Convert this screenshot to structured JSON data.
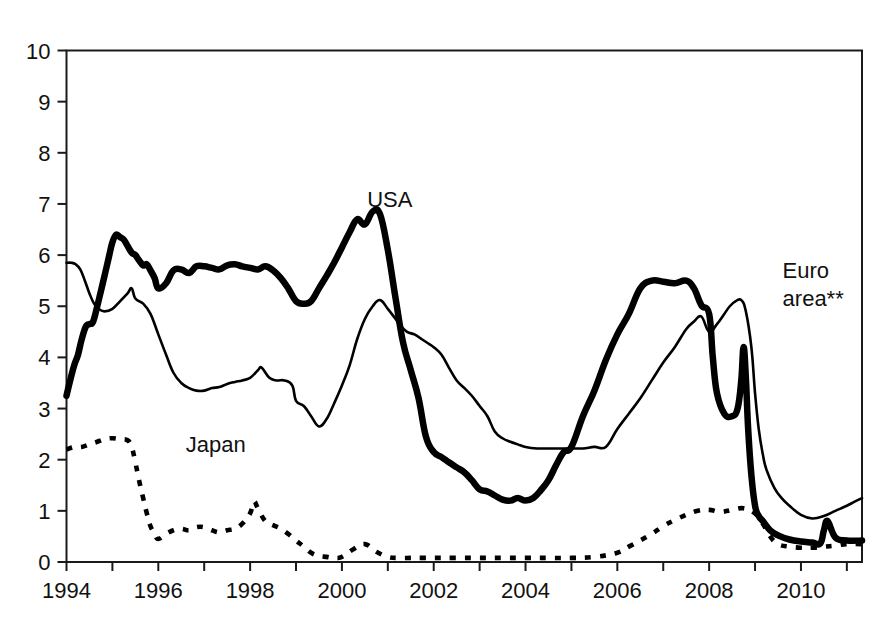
{
  "chart_data": {
    "type": "line",
    "title": "",
    "subtitle": "",
    "xlabel": "",
    "ylabel": "",
    "xlim": [
      1994.0,
      2011.33
    ],
    "ylim": [
      0,
      10
    ],
    "ytick_values": [
      0,
      1,
      2,
      3,
      4,
      5,
      6,
      7,
      8,
      9,
      10
    ],
    "ytick_labels": [
      "0",
      "1",
      "2",
      "3",
      "4",
      "5",
      "6",
      "7",
      "8",
      "9",
      "10"
    ],
    "xtick_values": [
      1994,
      1996,
      1998,
      2000,
      2002,
      2004,
      2006,
      2008,
      2010
    ],
    "xtick_labels": [
      "1994",
      "1996",
      "1998",
      "2000",
      "2002",
      "2004",
      "2006",
      "2008",
      "2010"
    ],
    "xtick_minor_values": [
      1995,
      1997,
      1999,
      2001,
      2003,
      2005,
      2007,
      2009,
      2011
    ],
    "grid": false,
    "legend_position": "inline-annotations",
    "annotations": [
      {
        "text": "USA",
        "x": 2000.55,
        "y": 6.95
      },
      {
        "text": "Japan",
        "x": 1996.6,
        "y": 2.15
      },
      {
        "text": "Euro",
        "x": 2009.6,
        "y": 5.55
      },
      {
        "text": "area**",
        "x": 2009.6,
        "y": 5.0
      }
    ],
    "series": [
      {
        "name": "USA",
        "style": "thick-solid",
        "color": "#000000",
        "x": [
          1994.0,
          1994.08,
          1994.17,
          1994.25,
          1994.33,
          1994.42,
          1994.5,
          1994.58,
          1994.67,
          1994.75,
          1994.83,
          1994.92,
          1995.0,
          1995.08,
          1995.17,
          1995.25,
          1995.33,
          1995.42,
          1995.5,
          1995.58,
          1995.67,
          1995.75,
          1995.83,
          1995.92,
          1996.0,
          1996.17,
          1996.33,
          1996.5,
          1996.67,
          1996.83,
          1997.0,
          1997.17,
          1997.33,
          1997.5,
          1997.67,
          1997.83,
          1998.0,
          1998.17,
          1998.33,
          1998.5,
          1998.67,
          1998.83,
          1999.0,
          1999.17,
          1999.33,
          1999.5,
          1999.67,
          1999.83,
          2000.0,
          2000.17,
          2000.33,
          2000.5,
          2000.67,
          2000.83,
          2001.0,
          2001.17,
          2001.33,
          2001.5,
          2001.67,
          2001.83,
          2002.0,
          2002.17,
          2002.33,
          2002.5,
          2002.67,
          2002.83,
          2003.0,
          2003.17,
          2003.33,
          2003.5,
          2003.67,
          2003.83,
          2004.0,
          2004.17,
          2004.33,
          2004.5,
          2004.67,
          2004.83,
          2005.0,
          2005.25,
          2005.5,
          2005.75,
          2006.0,
          2006.25,
          2006.5,
          2006.75,
          2007.0,
          2007.25,
          2007.5,
          2007.67,
          2007.83,
          2008.0,
          2008.08,
          2008.17,
          2008.33,
          2008.5,
          2008.62,
          2008.7,
          2008.75,
          2008.8,
          2008.85,
          2008.92,
          2009.0,
          2009.08,
          2009.17,
          2009.33,
          2009.5,
          2009.75,
          2010.0,
          2010.25,
          2010.42,
          2010.5,
          2010.58,
          2010.75,
          2011.0,
          2011.33
        ],
        "y": [
          3.25,
          3.55,
          3.85,
          4.05,
          4.35,
          4.6,
          4.65,
          4.7,
          5.0,
          5.3,
          5.6,
          5.95,
          6.25,
          6.4,
          6.35,
          6.3,
          6.18,
          6.05,
          6.0,
          5.9,
          5.8,
          5.82,
          5.7,
          5.55,
          5.35,
          5.45,
          5.7,
          5.72,
          5.65,
          5.78,
          5.78,
          5.75,
          5.72,
          5.8,
          5.82,
          5.78,
          5.75,
          5.72,
          5.78,
          5.7,
          5.55,
          5.35,
          5.1,
          5.05,
          5.1,
          5.35,
          5.6,
          5.85,
          6.15,
          6.45,
          6.7,
          6.6,
          6.85,
          6.8,
          6.1,
          5.15,
          4.3,
          3.75,
          3.2,
          2.45,
          2.15,
          2.05,
          1.95,
          1.85,
          1.75,
          1.6,
          1.42,
          1.38,
          1.3,
          1.22,
          1.2,
          1.25,
          1.2,
          1.25,
          1.4,
          1.6,
          1.9,
          2.15,
          2.25,
          2.85,
          3.35,
          3.95,
          4.45,
          4.85,
          5.35,
          5.5,
          5.48,
          5.45,
          5.5,
          5.35,
          5.02,
          4.85,
          4.0,
          3.3,
          2.9,
          2.85,
          3.0,
          3.55,
          4.2,
          3.6,
          2.6,
          1.7,
          1.1,
          0.9,
          0.8,
          0.62,
          0.52,
          0.44,
          0.4,
          0.38,
          0.36,
          0.62,
          0.8,
          0.48,
          0.42,
          0.42
        ]
      },
      {
        "name": "Euro area**",
        "style": "thin-solid",
        "color": "#000000",
        "x": [
          1994.0,
          1994.1,
          1994.2,
          1994.3,
          1994.4,
          1994.5,
          1994.6,
          1994.7,
          1994.83,
          1995.0,
          1995.17,
          1995.33,
          1995.42,
          1995.5,
          1995.67,
          1995.83,
          1996.0,
          1996.17,
          1996.33,
          1996.5,
          1996.67,
          1996.83,
          1997.0,
          1997.17,
          1997.33,
          1997.5,
          1997.67,
          1997.83,
          1998.0,
          1998.17,
          1998.25,
          1998.42,
          1998.58,
          1998.75,
          1998.92,
          1999.0,
          1999.17,
          1999.33,
          1999.5,
          1999.67,
          1999.83,
          2000.0,
          2000.17,
          2000.33,
          2000.5,
          2000.67,
          2000.83,
          2001.0,
          2001.17,
          2001.25,
          2001.42,
          2001.58,
          2001.75,
          2001.92,
          2002.0,
          2002.17,
          2002.33,
          2002.5,
          2002.67,
          2002.83,
          2003.0,
          2003.17,
          2003.33,
          2003.5,
          2003.67,
          2003.83,
          2004.0,
          2004.25,
          2004.5,
          2004.75,
          2005.0,
          2005.25,
          2005.5,
          2005.75,
          2006.0,
          2006.25,
          2006.5,
          2006.75,
          2007.0,
          2007.25,
          2007.5,
          2007.67,
          2007.83,
          2008.0,
          2008.17,
          2008.33,
          2008.45,
          2008.58,
          2008.7,
          2008.8,
          2008.92,
          2009.0,
          2009.08,
          2009.17,
          2009.25,
          2009.42,
          2009.58,
          2009.75,
          2010.0,
          2010.25,
          2010.5,
          2010.75,
          2011.0,
          2011.17,
          2011.33
        ],
        "y": [
          5.85,
          5.85,
          5.82,
          5.72,
          5.5,
          5.25,
          5.05,
          4.95,
          4.9,
          4.95,
          5.1,
          5.25,
          5.35,
          5.15,
          5.05,
          4.85,
          4.45,
          4.05,
          3.7,
          3.5,
          3.4,
          3.35,
          3.35,
          3.4,
          3.42,
          3.48,
          3.52,
          3.55,
          3.6,
          3.75,
          3.8,
          3.6,
          3.55,
          3.55,
          3.45,
          3.15,
          3.05,
          2.85,
          2.65,
          2.8,
          3.1,
          3.45,
          3.85,
          4.35,
          4.75,
          5.0,
          5.12,
          4.95,
          4.75,
          4.65,
          4.5,
          4.45,
          4.35,
          4.25,
          4.2,
          4.05,
          3.8,
          3.55,
          3.4,
          3.25,
          3.05,
          2.85,
          2.55,
          2.42,
          2.35,
          2.3,
          2.25,
          2.22,
          2.22,
          2.22,
          2.22,
          2.22,
          2.25,
          2.25,
          2.6,
          2.9,
          3.2,
          3.55,
          3.9,
          4.2,
          4.55,
          4.7,
          4.8,
          4.5,
          4.65,
          4.85,
          5.0,
          5.1,
          5.12,
          4.9,
          4.2,
          3.3,
          2.6,
          2.1,
          1.8,
          1.45,
          1.25,
          1.1,
          0.92,
          0.85,
          0.9,
          1.0,
          1.1,
          1.18,
          1.25
        ]
      },
      {
        "name": "Japan",
        "style": "dotted",
        "color": "#000000",
        "x": [
          1994.0,
          1994.17,
          1994.33,
          1994.5,
          1994.67,
          1994.83,
          1995.0,
          1995.17,
          1995.33,
          1995.42,
          1995.5,
          1995.58,
          1995.67,
          1995.75,
          1995.83,
          1995.92,
          1996.0,
          1996.17,
          1996.33,
          1996.5,
          1996.67,
          1996.83,
          1997.0,
          1997.17,
          1997.33,
          1997.5,
          1997.67,
          1997.83,
          1998.0,
          1998.08,
          1998.17,
          1998.33,
          1998.5,
          1998.67,
          1998.83,
          1999.0,
          1999.17,
          1999.33,
          1999.5,
          1999.67,
          1999.83,
          2000.0,
          2000.25,
          2000.5,
          2000.75,
          2001.0,
          2001.25,
          2001.5,
          2001.75,
          2002.0,
          2002.5,
          2003.0,
          2003.5,
          2004.0,
          2004.5,
          2005.0,
          2005.5,
          2006.0,
          2006.25,
          2006.5,
          2006.75,
          2007.0,
          2007.25,
          2007.5,
          2007.75,
          2008.0,
          2008.25,
          2008.5,
          2008.75,
          2009.0,
          2009.17,
          2009.33,
          2009.5,
          2009.75,
          2010.0,
          2010.25,
          2010.5,
          2010.75,
          2011.0,
          2011.33
        ],
        "y": [
          2.2,
          2.25,
          2.25,
          2.3,
          2.35,
          2.4,
          2.42,
          2.4,
          2.38,
          2.25,
          1.95,
          1.6,
          1.25,
          0.95,
          0.7,
          0.55,
          0.45,
          0.55,
          0.62,
          0.65,
          0.62,
          0.68,
          0.68,
          0.62,
          0.58,
          0.62,
          0.65,
          0.75,
          0.95,
          1.18,
          1.05,
          0.8,
          0.72,
          0.65,
          0.55,
          0.42,
          0.3,
          0.18,
          0.12,
          0.1,
          0.08,
          0.1,
          0.25,
          0.35,
          0.2,
          0.1,
          0.08,
          0.08,
          0.08,
          0.08,
          0.08,
          0.08,
          0.08,
          0.08,
          0.08,
          0.08,
          0.1,
          0.18,
          0.3,
          0.42,
          0.55,
          0.7,
          0.82,
          0.92,
          1.0,
          1.02,
          0.98,
          1.02,
          1.05,
          0.95,
          0.75,
          0.5,
          0.35,
          0.3,
          0.28,
          0.28,
          0.3,
          0.32,
          0.35,
          0.35
        ]
      }
    ]
  }
}
